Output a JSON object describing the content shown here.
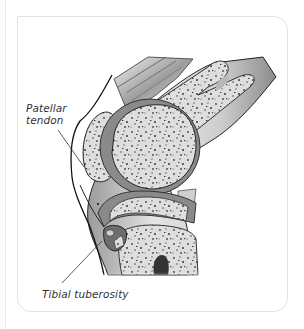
{
  "figure": {
    "labels": {
      "patellar_tendon": "Patellar tendon",
      "patellar_tendon_line1": "Patellar",
      "patellar_tendon_line2": "tendon",
      "tibial_tuberosity": "Tibial tuberosity"
    },
    "colors": {
      "bone_fill": "#dadada",
      "cartilage": "#8a8a8a",
      "outline": "#222222",
      "soft_tissue": "#c8c8c8",
      "card_border": "#e2e2e2"
    }
  }
}
